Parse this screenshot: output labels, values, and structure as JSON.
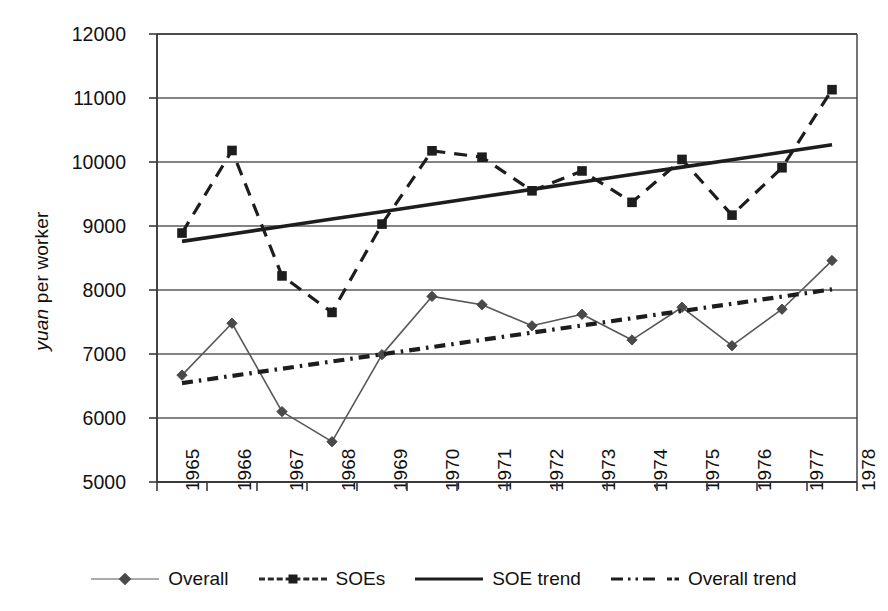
{
  "axes": {
    "y_title_italic": "yuan",
    "y_title_rest": " per worker",
    "y_ticks": [
      "12000",
      "11000",
      "10000",
      "9000",
      "8000",
      "7000",
      "6000",
      "5000"
    ],
    "x_ticks": [
      "1965",
      "1966",
      "1967",
      "1968",
      "1969",
      "1970",
      "1971",
      "1972",
      "1973",
      "1974",
      "1975",
      "1976",
      "1977",
      "1978"
    ]
  },
  "legend": {
    "items": [
      {
        "label": "Overall",
        "key": "overall-line-diamond"
      },
      {
        "label": "SOEs",
        "key": "soes-dashed-square"
      },
      {
        "label": "SOE trend",
        "key": "soe-trend-solid"
      },
      {
        "label": "Overall trend",
        "key": "overall-trend-dashdot"
      }
    ]
  },
  "chart_data": {
    "type": "line",
    "title": "",
    "xlabel": "",
    "ylabel": "yuan per worker",
    "x": [
      1965,
      1966,
      1967,
      1968,
      1969,
      1970,
      1971,
      1972,
      1973,
      1974,
      1975,
      1976,
      1977,
      1978
    ],
    "categories": [
      "1965",
      "1966",
      "1967",
      "1968",
      "1969",
      "1970",
      "1971",
      "1972",
      "1973",
      "1974",
      "1975",
      "1976",
      "1977",
      "1978"
    ],
    "ylim": [
      5000,
      12000
    ],
    "ytick_step": 1000,
    "grid": true,
    "legend_position": "bottom",
    "series": [
      {
        "name": "Overall",
        "marker": "diamond",
        "linestyle": "solid",
        "color": "#58585a",
        "values": [
          6670,
          7480,
          6100,
          5630,
          6990,
          7900,
          7770,
          7440,
          7620,
          7220,
          7730,
          7130,
          7700,
          8460
        ]
      },
      {
        "name": "SOEs",
        "marker": "square",
        "linestyle": "dashed",
        "color": "#1d1d1d",
        "values": [
          8890,
          10180,
          8220,
          7650,
          9030,
          10175,
          10075,
          9550,
          9860,
          9370,
          10040,
          9170,
          9910,
          11130
        ]
      },
      {
        "name": "SOE trend",
        "marker": "none",
        "linestyle": "solid",
        "color": "#1d1d1d",
        "endpoints": [
          8760,
          10270
        ],
        "values": [
          8760,
          8876,
          8992,
          9108,
          9224,
          9340,
          9456,
          9572,
          9688,
          9804,
          9920,
          10036,
          10152,
          10270
        ]
      },
      {
        "name": "Overall trend",
        "marker": "none",
        "linestyle": "dashdot",
        "color": "#1d1d1d",
        "endpoints": [
          6545,
          8010
        ],
        "values": [
          6545,
          6658,
          6770,
          6883,
          6996,
          7108,
          7221,
          7334,
          7446,
          7559,
          7672,
          7784,
          7897,
          8010
        ]
      }
    ]
  }
}
